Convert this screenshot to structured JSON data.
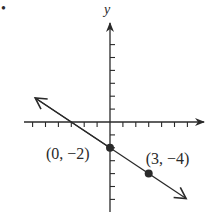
{
  "bullet": "•",
  "chart_data": {
    "type": "line",
    "title": "",
    "xlabel": "",
    "ylabel": "y",
    "xlim": [
      -6,
      7
    ],
    "ylim": [
      -6,
      7
    ],
    "grid": false,
    "tick_spacing": 1,
    "series": [
      {
        "name": "line",
        "equation": "y = -2/3 x - 2",
        "slope": -0.6667,
        "intercept": -2,
        "arrows": "both",
        "x": [
          -6,
          6
        ],
        "y": [
          2,
          -6
        ]
      }
    ],
    "points": [
      {
        "x": 0,
        "y": -2,
        "label": "(0, −2)"
      },
      {
        "x": 3,
        "y": -4,
        "label": "(3, −4)"
      }
    ]
  },
  "colors": {
    "ink": "#2a2a2a",
    "background": "#ffffff"
  }
}
